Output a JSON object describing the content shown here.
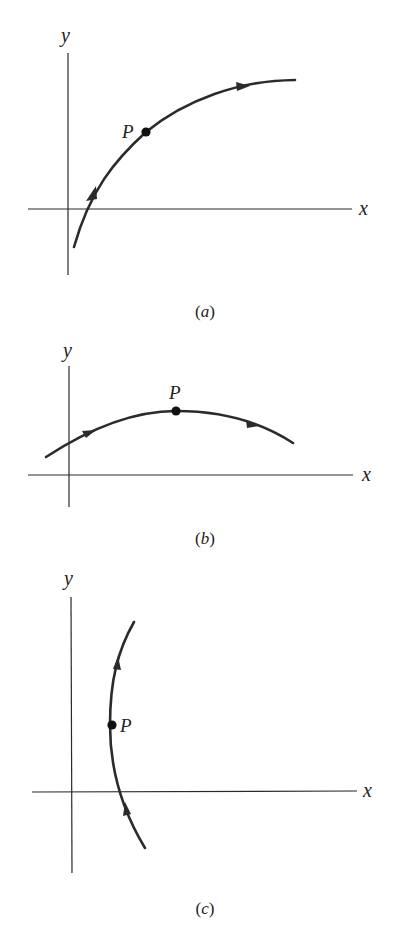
{
  "figure": {
    "panels": [
      {
        "id": "a",
        "caption_letter": "a",
        "axis_x_label": "x",
        "axis_y_label": "y",
        "point_label": "P",
        "description": "Curve rising from below x-axis, concave down, passing point P; arrows indicate direction of increasing parameter (up and to the right)."
      },
      {
        "id": "b",
        "caption_letter": "b",
        "axis_x_label": "x",
        "axis_y_label": "y",
        "point_label": "P",
        "description": "Arc above x-axis with maximum at P; arrows point left-to-right."
      },
      {
        "id": "c",
        "caption_letter": "c",
        "axis_x_label": "x",
        "axis_y_label": "y",
        "point_label": "P",
        "description": "Near-vertical curve bulging left with leftmost point P; arrows point upward."
      }
    ],
    "colors": {
      "ink": "#2b2b2b",
      "background": "#ffffff"
    }
  }
}
